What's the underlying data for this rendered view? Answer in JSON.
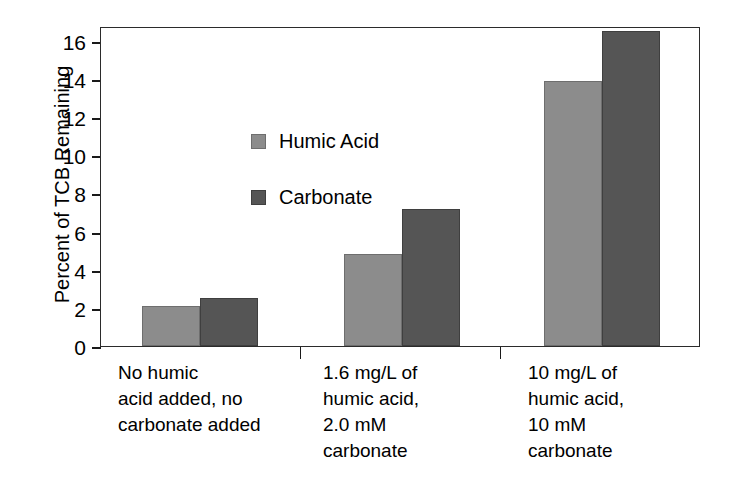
{
  "chart_data": {
    "type": "bar",
    "title": "",
    "xlabel": "",
    "ylabel": "Percent of TCB Remaining",
    "ylim": [
      0,
      16
    ],
    "yticks": [
      0,
      2,
      4,
      6,
      8,
      10,
      12,
      14,
      16
    ],
    "ytick_labels": [
      "0",
      "2",
      "4",
      "6",
      "8",
      "10",
      "12",
      "14",
      "16"
    ],
    "grid": false,
    "legend_position": "upper-left-inside",
    "categories": [
      "No humic\nacid added, no\ncarbonate added",
      "1.6 mg/L of\nhumic acid,\n2.0 mM\ncarbonate",
      "10 mg/L of\nhumic acid,\n10 mM\ncarbonate"
    ],
    "series": [
      {
        "name": "Humic Acid",
        "color": "#8c8c8c",
        "values": [
          2.0,
          4.65,
          13.35
        ]
      },
      {
        "name": "Carbonate",
        "color": "#555555",
        "values": [
          2.4,
          6.9,
          15.85
        ]
      }
    ]
  },
  "legend": {
    "items": [
      {
        "label": "Humic Acid"
      },
      {
        "label": "Carbonate"
      }
    ]
  },
  "axis": {
    "y_title": "Percent of TCB Remaining",
    "y_tick_labels": [
      "16",
      "14",
      "12",
      "10",
      "8",
      "6",
      "4",
      "2",
      "0"
    ]
  },
  "x_labels": [
    "No humic\nacid added, no\ncarbonate added",
    "1.6 mg/L of\nhumic acid,\n2.0 mM\ncarbonate",
    "10 mg/L of\nhumic acid,\n10 mM\ncarbonate"
  ]
}
